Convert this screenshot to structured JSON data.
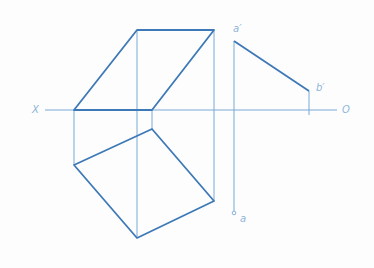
{
  "figure": {
    "colors": {
      "thick": "#3d79b6",
      "thin": "#7ba9d6",
      "label": "#8fb6d8"
    },
    "axis": {
      "left_label": "X",
      "right_label": "O",
      "y": 110,
      "x_start": 45,
      "x_end": 337
    },
    "front_view": {
      "polygon": [
        [
          137,
          30
        ],
        [
          214,
          30
        ],
        [
          152,
          110
        ],
        [
          74,
          110
        ]
      ]
    },
    "top_view": {
      "polygon": [
        [
          74,
          165
        ],
        [
          152,
          129
        ],
        [
          214,
          201
        ],
        [
          137,
          238
        ]
      ]
    },
    "projection_lines": [
      {
        "x": 74,
        "y1": 110,
        "y2": 165
      },
      {
        "x": 137,
        "y1": 30,
        "y2": 238
      },
      {
        "x": 152,
        "y1": 110,
        "y2": 129
      },
      {
        "x": 214,
        "y1": 30,
        "y2": 201
      },
      {
        "x": 234,
        "y1": 41,
        "y2": 211
      },
      {
        "x": 309,
        "y1": 91,
        "y2": 115
      }
    ],
    "line_ab": {
      "a_prime": [
        234,
        41
      ],
      "b_prime": [
        309,
        91
      ],
      "a": [
        234,
        213
      ]
    },
    "labels": {
      "a_prime": "a′",
      "b_prime": "b′",
      "a": "a"
    }
  }
}
